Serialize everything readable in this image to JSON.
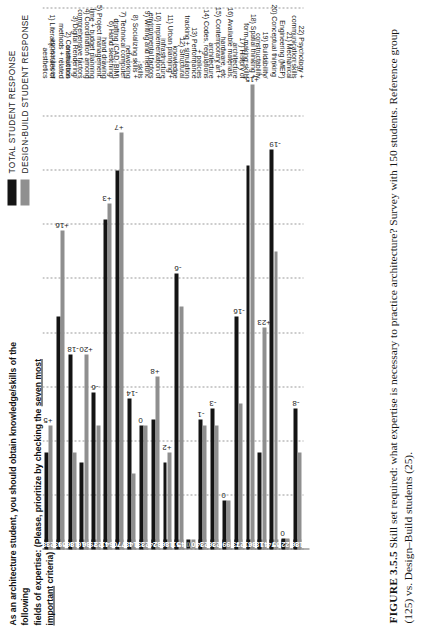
{
  "figure": {
    "caption_label": "FIGURE 3.5.5",
    "caption_text": "Skill set required: what expertise is necessary to practice architecture? Survey with 150 students. Reference group (125) vs. Design–Build students (25)."
  },
  "question": {
    "line1": "As an architecture student, you should obtain knowledge/skills of the following",
    "line2_a": "fields of expertise: (Please, prioritize by checking the ",
    "line2_underlined": "seven most important",
    "line2_b": " criteria)"
  },
  "legend": {
    "items": [
      {
        "label": "TOTAL STUDENT RESPONSE",
        "color": "#141414",
        "key": "total"
      },
      {
        "label": "DESIGN-BUILD STUDENT RESPONSE",
        "color": "#8f8f8f",
        "key": "db"
      }
    ]
  },
  "chart_data": {
    "type": "bar",
    "orientation": "horizontal",
    "title": "As an architecture student, you should obtain knowledge/skills of the following fields of expertise: (Please, prioritize by checking the seven most important criteria)",
    "xlabel": "",
    "ylabel": "",
    "xlim": [
      0,
      100
    ],
    "grid": true,
    "gridlines": [
      0,
      10,
      20,
      30,
      40,
      50,
      60,
      70,
      80,
      90,
      100
    ],
    "legend_position": "top-right",
    "categories": [
      "1) Literacy in rules of aesthetics",
      "2) Construction methods + related appearances",
      "3) Digital Rendering/ animations",
      "4) Coordination among comprehensive factors",
      "5) Project management: time + budget planning",
      "6) Hand sketching/ hand drawing",
      "7) Technical computer drafting (CAD, BIM)",
      "8) Socializing skills + networking",
      "9) Writing and rhetoric skills",
      "10) Implementation of environmental factors",
      "11) Urban planning + infrastructure",
      "12) Structural knowledge",
      "13) Performance tracking + simulation",
      "14) Codes, regulations + policies",
      "15) Contemporary art + architecture",
      "16) Available materials, hardware, etc",
      "17) History of architecture",
      "18) Spatial thinking + form-making skills",
      "19) Buildability/ constructability",
      "20) Conceptual thinking",
      "21) Mechanical Engineering (MEP)",
      "22) Psychology + communication skills"
    ],
    "series": [
      {
        "name": "TOTAL STUDENT RESPONSE",
        "key": "total",
        "color": "#141414",
        "values": [
          18,
          43,
          36,
          16,
          29,
          61,
          70,
          28,
          23,
          24,
          16,
          51,
          0,
          24,
          26,
          9,
          43,
          71,
          18,
          74,
          2,
          26
        ]
      },
      {
        "name": "DESIGN-BUILD STUDENT RESPONSE",
        "key": "db",
        "color": "#8f8f8f",
        "values": [
          23,
          59,
          18,
          36,
          23,
          64,
          77,
          14,
          23,
          32,
          18,
          45,
          0,
          23,
          23,
          9,
          27,
          86,
          41,
          55,
          2,
          18
        ]
      }
    ],
    "deltas": [
      "+5",
      "+16",
      "-18",
      "+20",
      "-6",
      "+3",
      "+7",
      "-14",
      "0",
      "+8",
      "+2",
      "-6",
      "0",
      "-1",
      "-3",
      "0",
      "-16",
      "+15",
      "+23",
      "-19",
      "0",
      "-8"
    ]
  }
}
